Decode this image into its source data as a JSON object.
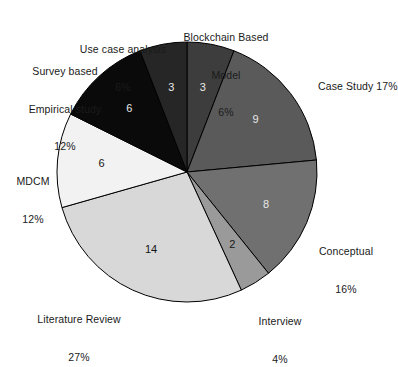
{
  "chart": {
    "type": "pie",
    "title": "",
    "center_x": 187,
    "center_y": 172,
    "radius": 130,
    "start_angle_deg": 0,
    "direction": "clockwise",
    "total": 51
  },
  "chart_data": {
    "type": "pie",
    "title": "",
    "subtitle": "",
    "xlabel": "",
    "ylabel": "",
    "legend_position": "callout-labels",
    "grid": false,
    "total": 51,
    "categories": [
      "Blockchain Based Model",
      "Case Study",
      "Conceptual",
      "Interview",
      "Literature Review",
      "MDCM",
      "Survey based Empirical study",
      "Use case analysis"
    ],
    "values": [
      3,
      9,
      8,
      2,
      14,
      6,
      6,
      3
    ],
    "percentages": [
      6,
      17,
      16,
      4,
      27,
      12,
      12,
      6
    ],
    "colors": [
      "#3d3d3d",
      "#5a5a5a",
      "#707070",
      "#9a9a9a",
      "#d8d8d8",
      "#f2f2f2",
      "#0a0a0a",
      "#262626"
    ],
    "slices": [
      {
        "label": "Blockchain Based Model",
        "label_line1": "Blockchain Based",
        "label_line2": "Model",
        "percent_text": "6%",
        "value": 3,
        "value_text": "3",
        "color": "#3d3d3d",
        "value_text_color": "light"
      },
      {
        "label": "Case Study",
        "label_line1": "Case Study 17%",
        "label_line2": "",
        "percent_text": "17%",
        "value": 9,
        "value_text": "9",
        "color": "#5a5a5a",
        "value_text_color": "light"
      },
      {
        "label": "Conceptual",
        "label_line1": "Conceptual",
        "label_line2": "",
        "percent_text": "16%",
        "value": 8,
        "value_text": "8",
        "color": "#707070",
        "value_text_color": "light"
      },
      {
        "label": "Interview",
        "label_line1": "Interview",
        "label_line2": "",
        "percent_text": "4%",
        "value": 2,
        "value_text": "2",
        "color": "#9a9a9a",
        "value_text_color": "dark"
      },
      {
        "label": "Literature Review",
        "label_line1": "Literature Review",
        "label_line2": "",
        "percent_text": "27%",
        "value": 14,
        "value_text": "14",
        "color": "#d8d8d8",
        "value_text_color": "dark"
      },
      {
        "label": "MDCM",
        "label_line1": "MDCM",
        "label_line2": "",
        "percent_text": "12%",
        "value": 6,
        "value_text": "6",
        "color": "#f2f2f2",
        "value_text_color": "dark"
      },
      {
        "label": "Survey based Empirical study",
        "label_line1": "Survey based",
        "label_line2": "Empirical study",
        "percent_text": "12%",
        "value": 6,
        "value_text": "6",
        "color": "#0a0a0a",
        "value_text_color": "light"
      },
      {
        "label": "Use case analysis",
        "label_line1": "Use case analysis",
        "label_line2": "",
        "percent_text": "6%",
        "value": 3,
        "value_text": "3",
        "color": "#262626",
        "value_text_color": "light"
      }
    ]
  },
  "callouts": {
    "blockchain": {
      "line1": "Blockchain Based",
      "line2": "Model",
      "percent": "6%"
    },
    "case_study": {
      "line1": "Case Study 17%",
      "line2": "",
      "percent": ""
    },
    "conceptual": {
      "line1": "Conceptual",
      "line2": "",
      "percent": "16%"
    },
    "interview": {
      "line1": "Interview",
      "line2": "",
      "percent": "4%"
    },
    "literature_review": {
      "line1": "Literature Review",
      "line2": "",
      "percent": "27%"
    },
    "mdcm": {
      "line1": "MDCM",
      "line2": "",
      "percent": "12%"
    },
    "survey": {
      "line1": "Survey based",
      "line2": "Empirical study",
      "percent": "12%"
    },
    "use_case": {
      "line1": "Use case analysis",
      "line2": "",
      "percent": "6%"
    }
  },
  "wedge_values": {
    "blockchain": "3",
    "case_study": "9",
    "conceptual": "8",
    "interview": "2",
    "literature_review": "14",
    "mdcm": "6",
    "survey": "6",
    "use_case": "3"
  }
}
